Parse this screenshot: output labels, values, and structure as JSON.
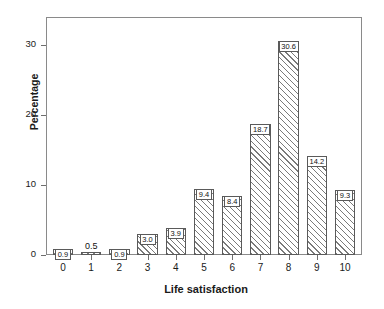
{
  "chart_data": {
    "type": "bar",
    "title": "",
    "xlabel": "Life satisfaction",
    "ylabel": "Percentage",
    "categories": [
      "0",
      "1",
      "2",
      "3",
      "4",
      "5",
      "6",
      "7",
      "8",
      "9",
      "10"
    ],
    "values": [
      0.9,
      0.5,
      0.9,
      3.0,
      3.9,
      9.4,
      8.4,
      18.7,
      30.6,
      14.2,
      9.3
    ],
    "data_labels": [
      "0.9",
      "0.5",
      "0.9",
      "3.0",
      "3.9",
      "9.4",
      "8.4",
      "18.7",
      "30.6",
      "14.2",
      "9.3"
    ],
    "ytick_labels": [
      "0",
      "10",
      "20",
      "30"
    ],
    "ytick_values": [
      0,
      10,
      20,
      30
    ],
    "ylim": [
      0,
      34
    ],
    "xlim": [
      -0.6,
      10.6
    ],
    "grid": false,
    "legend": false,
    "bar_style": "hatched-diagonal",
    "colors": {
      "bar_edge": "#5a5a5a",
      "bar_hatch": "#7a7a7a",
      "axis": "#8a8a8a",
      "text": "#1a1a1a"
    }
  }
}
